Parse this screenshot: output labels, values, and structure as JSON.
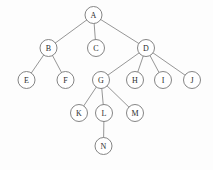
{
  "figure": {
    "background_color": "#fdfdfd",
    "node_fill": "#ffffff",
    "node_stroke": "#777777",
    "edge_color": "#8a8a8a",
    "label_color": "#2b2b2b",
    "node_radius": 8.5,
    "width": 213,
    "height": 170
  },
  "chart_data": {
    "type": "diagram",
    "diagram_type": "tree",
    "root": "A",
    "nodes": [
      {
        "id": "A",
        "label": "A",
        "x": 93.5,
        "y": 15,
        "level": 0
      },
      {
        "id": "B",
        "label": "B",
        "x": 48.5,
        "y": 48,
        "level": 1
      },
      {
        "id": "C",
        "label": "C",
        "x": 96,
        "y": 48,
        "level": 1
      },
      {
        "id": "D",
        "label": "D",
        "x": 146,
        "y": 48,
        "level": 1
      },
      {
        "id": "E",
        "label": "E",
        "x": 26.5,
        "y": 80,
        "level": 2
      },
      {
        "id": "F",
        "label": "F",
        "x": 65.5,
        "y": 80,
        "level": 2
      },
      {
        "id": "G",
        "label": "G",
        "x": 101,
        "y": 80,
        "level": 2
      },
      {
        "id": "H",
        "label": "H",
        "x": 135,
        "y": 80,
        "level": 2
      },
      {
        "id": "I",
        "label": "I",
        "x": 163,
        "y": 80,
        "level": 2
      },
      {
        "id": "J",
        "label": "J",
        "x": 192,
        "y": 80,
        "level": 2
      },
      {
        "id": "K",
        "label": "K",
        "x": 79,
        "y": 113,
        "level": 3
      },
      {
        "id": "L",
        "label": "L",
        "x": 104,
        "y": 113,
        "level": 3
      },
      {
        "id": "M",
        "label": "M",
        "x": 135,
        "y": 113,
        "level": 3
      },
      {
        "id": "N",
        "label": "N",
        "x": 103.5,
        "y": 146,
        "level": 4
      }
    ],
    "edges": [
      {
        "from": "A",
        "to": "B"
      },
      {
        "from": "A",
        "to": "C"
      },
      {
        "from": "A",
        "to": "D"
      },
      {
        "from": "B",
        "to": "E"
      },
      {
        "from": "B",
        "to": "F"
      },
      {
        "from": "D",
        "to": "G"
      },
      {
        "from": "D",
        "to": "H"
      },
      {
        "from": "D",
        "to": "I"
      },
      {
        "from": "D",
        "to": "J"
      },
      {
        "from": "G",
        "to": "K"
      },
      {
        "from": "G",
        "to": "L"
      },
      {
        "from": "G",
        "to": "M"
      },
      {
        "from": "L",
        "to": "N"
      }
    ]
  }
}
